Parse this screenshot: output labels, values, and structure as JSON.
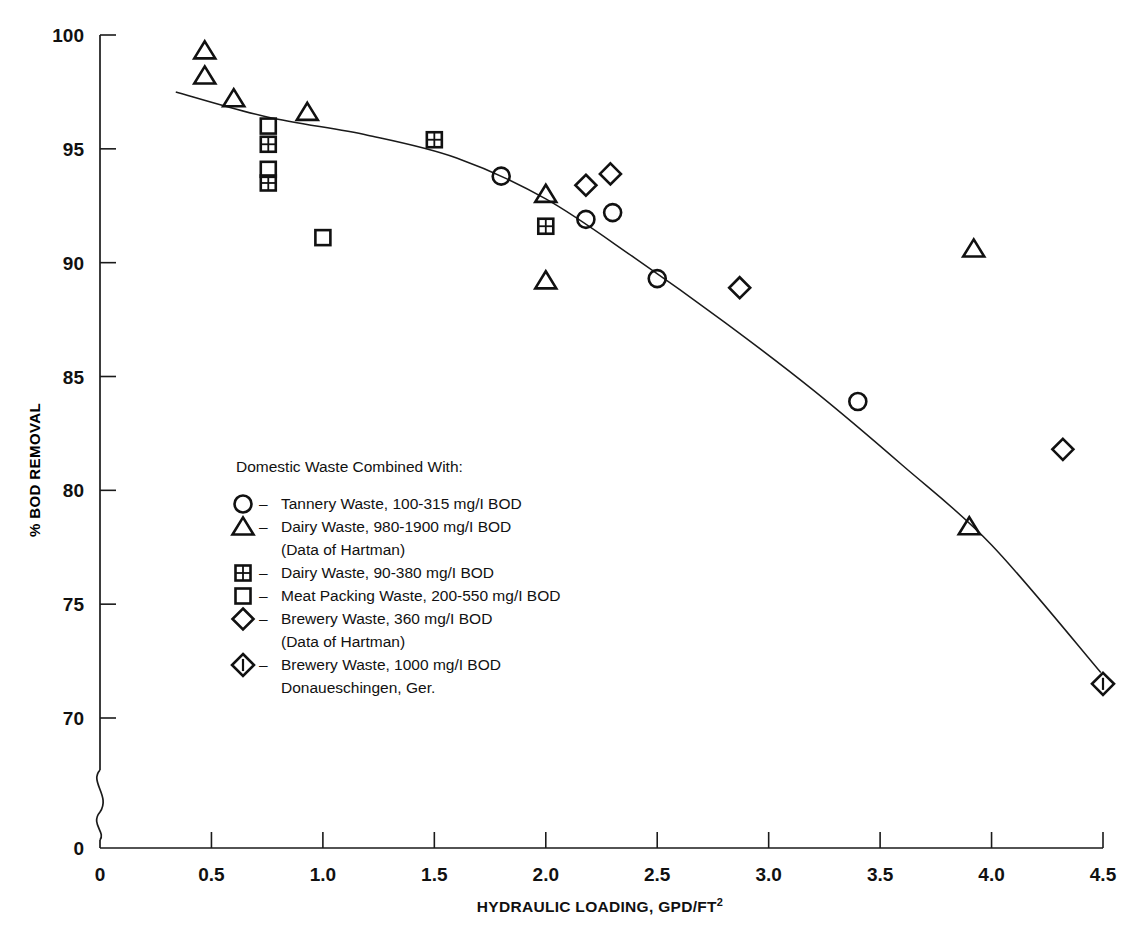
{
  "chart_data": {
    "type": "scatter",
    "title": "",
    "xlabel": "HYDRAULIC LOADING, GPD/FT²",
    "ylabel": "% BOD REMOVAL",
    "xlim": [
      0,
      4.5
    ],
    "ylim": [
      70,
      100
    ],
    "y_axis_break": true,
    "y_break_label": "0",
    "grid": false,
    "legend_position": "inside-left",
    "xticks": [
      "0",
      "0.5",
      "1.0",
      "1.5",
      "2.0",
      "2.5",
      "3.0",
      "3.5",
      "4.0",
      "4.5"
    ],
    "xtick_values": [
      0,
      0.5,
      1.0,
      1.5,
      2.0,
      2.5,
      3.0,
      3.5,
      4.0,
      4.5
    ],
    "yticks": [
      "70",
      "75",
      "80",
      "85",
      "90",
      "95",
      "100"
    ],
    "ytick_values": [
      70,
      75,
      80,
      85,
      90,
      95,
      100
    ],
    "legend_heading": "Domestic Waste Combined With:",
    "series": [
      {
        "name": "Tannery Waste, 100-315 mg/l BOD",
        "marker": "circle",
        "points": [
          {
            "x": 1.8,
            "y": 93.8
          },
          {
            "x": 2.18,
            "y": 91.9
          },
          {
            "x": 2.3,
            "y": 92.2
          },
          {
            "x": 2.5,
            "y": 89.3
          },
          {
            "x": 3.4,
            "y": 83.9
          }
        ]
      },
      {
        "name": "Dairy Waste, 980-1900 mg/l BOD",
        "name_note": "(Data of Hartman)",
        "marker": "triangle",
        "points": [
          {
            "x": 0.47,
            "y": 99.3
          },
          {
            "x": 0.47,
            "y": 98.2
          },
          {
            "x": 0.6,
            "y": 97.2
          },
          {
            "x": 0.93,
            "y": 96.6
          },
          {
            "x": 2.0,
            "y": 93.0
          },
          {
            "x": 2.0,
            "y": 89.2
          },
          {
            "x": 3.92,
            "y": 90.6
          },
          {
            "x": 3.9,
            "y": 78.4
          }
        ]
      },
      {
        "name": "Dairy Waste, 90-380 mg/l BOD",
        "marker": "crossed-square",
        "points": [
          {
            "x": 0.755,
            "y": 95.2
          },
          {
            "x": 0.755,
            "y": 93.5
          },
          {
            "x": 1.5,
            "y": 95.4
          },
          {
            "x": 2.0,
            "y": 91.6
          }
        ]
      },
      {
        "name": "Meat Packing Waste, 200-550 mg/l BOD",
        "marker": "square",
        "points": [
          {
            "x": 0.755,
            "y": 96.0
          },
          {
            "x": 0.755,
            "y": 94.1
          },
          {
            "x": 1.0,
            "y": 91.1
          }
        ]
      },
      {
        "name": "Brewery Waste, 360 mg/l BOD",
        "name_note": "(Data of Hartman)",
        "marker": "diamond",
        "points": [
          {
            "x": 2.18,
            "y": 93.4
          },
          {
            "x": 2.29,
            "y": 93.9
          },
          {
            "x": 2.87,
            "y": 88.9
          },
          {
            "x": 4.32,
            "y": 81.8
          }
        ]
      },
      {
        "name": "Brewery Waste, 1000 mg/l BOD",
        "name_note": "Donaueschingen, Ger.",
        "marker": "dotted-diamond",
        "points": [
          {
            "x": 4.5,
            "y": 71.5
          }
        ]
      }
    ],
    "trend_line": {
      "description": "fitted curve of % BOD removal vs hydraulic loading",
      "points": [
        {
          "x": 0.34,
          "y": 97.5
        },
        {
          "x": 0.75,
          "y": 96.4
        },
        {
          "x": 1.2,
          "y": 95.6
        },
        {
          "x": 1.6,
          "y": 94.6
        },
        {
          "x": 2.0,
          "y": 92.8
        },
        {
          "x": 2.4,
          "y": 90.2
        },
        {
          "x": 2.8,
          "y": 87.4
        },
        {
          "x": 3.2,
          "y": 84.4
        },
        {
          "x": 3.6,
          "y": 81.1
        },
        {
          "x": 4.0,
          "y": 77.6
        },
        {
          "x": 4.49,
          "y": 72.0
        }
      ]
    }
  },
  "legend": {
    "heading": "Domestic Waste Combined With:",
    "dash": "–",
    "entries": [
      {
        "marker": "circle",
        "label": "Tannery Waste, 100-315 mg/I BOD",
        "sub": ""
      },
      {
        "marker": "triangle",
        "label": "Dairy Waste, 980-1900 mg/I BOD",
        "sub": "(Data of Hartman)"
      },
      {
        "marker": "crossed-square",
        "label": "Dairy Waste, 90-380 mg/I BOD",
        "sub": ""
      },
      {
        "marker": "square",
        "label": "Meat Packing Waste, 200-550 mg/I BOD",
        "sub": ""
      },
      {
        "marker": "diamond",
        "label": "Brewery Waste, 360 mg/I BOD",
        "sub": "(Data of Hartman)"
      },
      {
        "marker": "dotted-diamond",
        "label": "Brewery Waste, 1000 mg/I BOD",
        "sub": "Donaueschingen, Ger."
      }
    ]
  },
  "axes": {
    "x_title": "HYDRAULIC LOADING, GPD/FT",
    "x_title_sup": "2",
    "y_title": "% BOD REMOVAL",
    "y_origin_label": "0",
    "x_origin_label": "0"
  },
  "colors": {
    "ink": "#111111",
    "background": "#ffffff"
  }
}
